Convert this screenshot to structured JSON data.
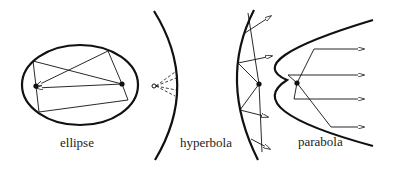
{
  "labels": {
    "ellipse": "ellipse",
    "hyperbola": "hyperbola",
    "parabola": "parabola"
  },
  "colors": {
    "stroke": "#111111",
    "background": "#ffffff"
  },
  "figures": [
    {
      "name": "ellipse",
      "description": "Ellipse with two foci and reflected rays between them"
    },
    {
      "name": "hyperbola",
      "description": "Two hyperbola branches; rays from a focus reflect outward"
    },
    {
      "name": "parabola",
      "description": "Parabola with rays from focus reflecting parallel"
    }
  ]
}
